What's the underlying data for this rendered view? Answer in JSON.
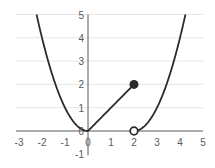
{
  "chart_data": {
    "type": "line",
    "title": "",
    "xlabel": "",
    "ylabel": "",
    "xlim": [
      -3,
      5
    ],
    "ylim": [
      -1,
      5
    ],
    "grid": {
      "horizontal": true,
      "vertical": false
    },
    "legend": null,
    "x_ticks": [
      "-3",
      "-2",
      "-1",
      "0",
      "1",
      "2",
      "3",
      "4",
      "5"
    ],
    "y_ticks": [
      "-1",
      "0",
      "1",
      "2",
      "3",
      "4",
      "5"
    ],
    "series": [
      {
        "name": "f(x) = x^2, x < 0",
        "x": [
          -2.236,
          -2,
          -1.5,
          -1,
          -0.5,
          0
        ],
        "y": [
          5,
          4,
          2.25,
          1,
          0.25,
          0
        ]
      },
      {
        "name": "f(x) = x, 0 <= x <= 2",
        "x": [
          0,
          2
        ],
        "y": [
          0,
          2
        ]
      },
      {
        "name": "f(x) = (x-2)^2, x > 2",
        "x": [
          2,
          2.5,
          3,
          3.5,
          4,
          4.236
        ],
        "y": [
          0,
          0.25,
          1,
          2.25,
          4,
          5
        ]
      }
    ],
    "markers": [
      {
        "x": 2,
        "y": 2,
        "style": "filled"
      },
      {
        "x": 2,
        "y": 0,
        "style": "open"
      }
    ],
    "colors": {
      "curve": "#2b2b2b",
      "axis": "#595959",
      "grid": "#e6e6e6"
    }
  }
}
